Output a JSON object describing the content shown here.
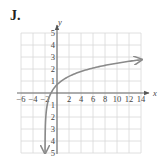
{
  "panel_label": "J.",
  "colors": {
    "grid": "#d8d8d8",
    "axis": "#6a6a6a",
    "curve": "#8a8a8a",
    "text": "#444444"
  },
  "chart_data": {
    "type": "line",
    "title": "J.",
    "xlabel": "x",
    "ylabel": "y",
    "xlim": [
      -6,
      14
    ],
    "ylim": [
      -5,
      5
    ],
    "grid": true,
    "x_ticks": [
      -6,
      -4,
      -2,
      2,
      4,
      6,
      8,
      10,
      12,
      14
    ],
    "y_ticks": [
      5,
      4,
      3,
      2,
      1,
      -1,
      -2,
      -3,
      -4,
      -5
    ],
    "x_tick_labels": [
      "−6",
      "−4",
      "−2",
      "2",
      "4",
      "6",
      "8",
      "10",
      "12",
      "14"
    ],
    "y_tick_labels": [
      "5",
      "4",
      "3",
      "2",
      "1",
      "1",
      "2",
      "3",
      "4",
      "5"
    ],
    "series": [
      {
        "name": "curve",
        "description": "logarithmic curve with vertical asymptote at x = -2, passing through (-1, 0) and approximately (0, 0.7), arrow toward (14, ~2.8) and downward toward y = -5",
        "x": [
          -1.99,
          -1.95,
          -1.9,
          -1.8,
          -1.6,
          -1.4,
          -1.0,
          -0.5,
          0,
          1,
          2,
          4,
          6,
          8,
          10,
          12,
          14
        ],
        "y": [
          -4.6,
          -3.0,
          -2.3,
          -1.6,
          -0.92,
          -0.51,
          0,
          0.41,
          0.69,
          1.1,
          1.39,
          1.79,
          2.08,
          2.3,
          2.48,
          2.64,
          2.77
        ]
      }
    ]
  }
}
